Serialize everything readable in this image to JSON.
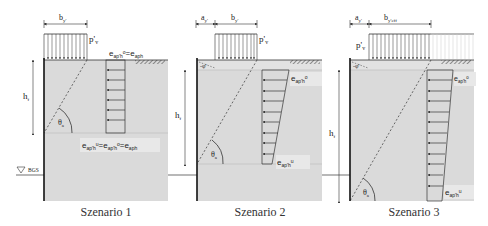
{
  "figure": {
    "colors": {
      "soil": "#dadada",
      "soil_upper_band": "#e4e4e4",
      "wall": "#111111",
      "line": "#333333",
      "label_bg": "#e8e8e8"
    },
    "panels": [
      {
        "caption": "Szenario 1",
        "dim_b": "b",
        "dim_b_sub": "y'",
        "load_label": "p'",
        "load_sub": "v",
        "height_label": "h",
        "height_sub": "f",
        "angle_label": "θ",
        "angle_sub": "a",
        "top_label": "e",
        "top_label_sub": "ap'h",
        "top_label_sup": "o",
        "top_label_tail": "=e",
        "top_label_tail_sub": "aph",
        "bottom_label": "e",
        "bottom_label_sub1": "ap'h",
        "bottom_label_sup1": "u",
        "bottom_label_mid": "=e",
        "bottom_label_sub2": "ap'h",
        "bottom_label_sup2": "o",
        "bottom_label_tail": "=e",
        "bottom_label_tail_sub": "aph",
        "water_label": "BGS"
      },
      {
        "caption": "Szenario 2",
        "dim_a": "a",
        "dim_a_sub": "y'",
        "dim_b": "b",
        "dim_b_sub": "y'",
        "load_label": "p'",
        "load_sub": "v",
        "slope_label": "-φ'",
        "height_label": "h",
        "height_sub": "f",
        "angle_label": "θ",
        "angle_sub": "a",
        "top_label": "e",
        "top_label_sub": "ap'h",
        "top_label_sup": "o",
        "bottom_label": "e",
        "bottom_label_sub": "ap'h",
        "bottom_label_sup": "u"
      },
      {
        "caption": "Szenario 3",
        "dim_a": "a",
        "dim_a_sub": "y'",
        "dim_b": "b",
        "dim_b_sub": "y'eff",
        "load_label": "p'",
        "load_sub": "v",
        "slope_label": "-φ'",
        "height_label": "h",
        "height_sub": "f",
        "angle_label": "θ",
        "angle_sub": "a",
        "top_label": "e",
        "top_label_sub": "ap'h",
        "top_label_sup": "o",
        "bottom_label": "e",
        "bottom_label_sub": "ap'h",
        "bottom_label_sup": "u"
      }
    ]
  }
}
